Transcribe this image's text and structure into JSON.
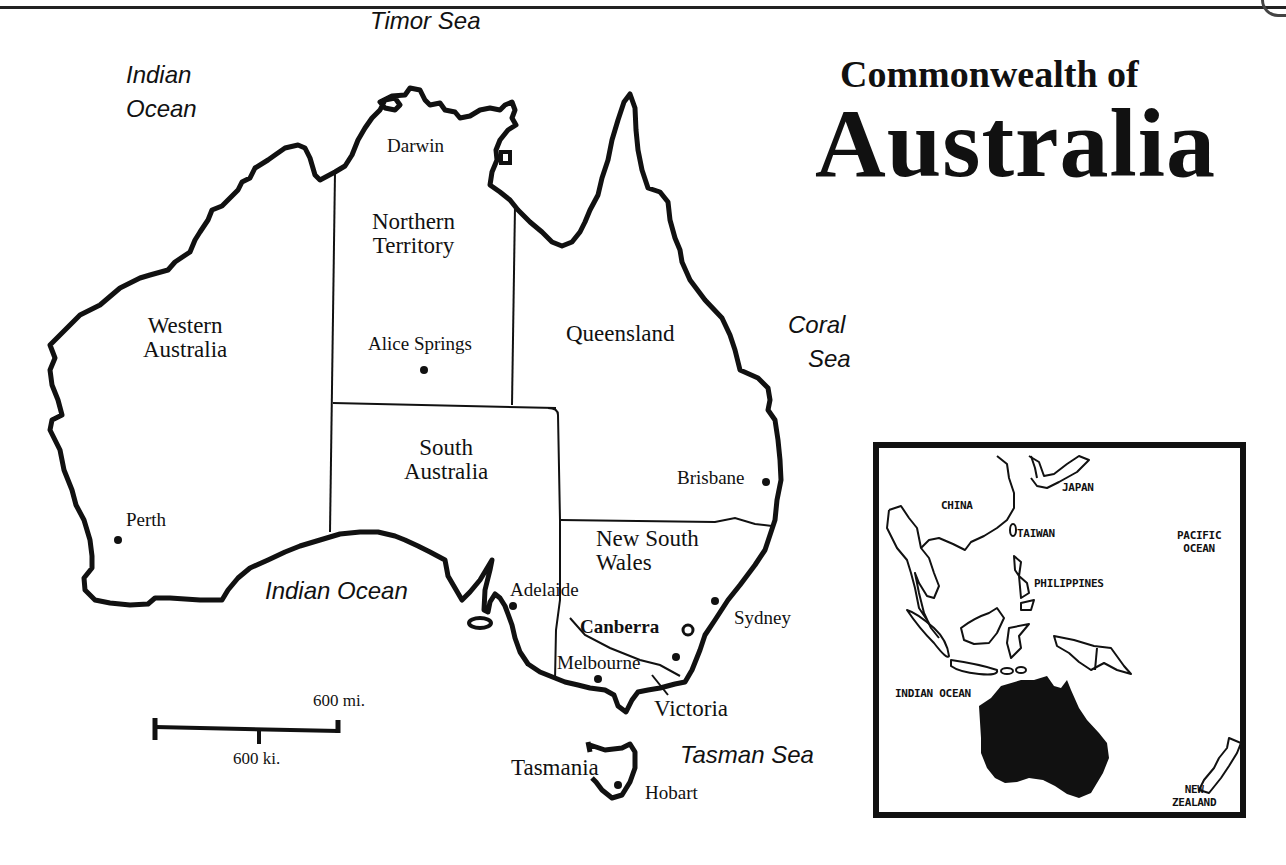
{
  "title": {
    "line1": "Commonwealth  of",
    "line2": "Australia"
  },
  "seas": {
    "timor_sea": "Timor Sea",
    "indian_ocean_nw_line1": "Indian",
    "indian_ocean_nw_line2": "Ocean",
    "indian_ocean_south": "Indian Ocean",
    "coral_sea_line1": "Coral",
    "coral_sea_line2": "Sea",
    "tasman_sea": "Tasman Sea"
  },
  "states": {
    "western_australia": [
      "Western",
      "Australia"
    ],
    "northern_territory": [
      "Northern",
      "Territory"
    ],
    "queensland": [
      "Queensland"
    ],
    "south_australia": [
      "South",
      "Australia"
    ],
    "new_south_wales": [
      "New South",
      "Wales"
    ],
    "victoria": [
      "Victoria"
    ],
    "tasmania": [
      "Tasmania"
    ]
  },
  "cities": {
    "darwin": "Darwin",
    "alice_springs": "Alice Springs",
    "perth": "Perth",
    "brisbane": "Brisbane",
    "adelaide": "Adelaide",
    "canberra": "Canberra",
    "sydney": "Sydney",
    "melbourne": "Melbourne",
    "hobart": "Hobart"
  },
  "scale": {
    "miles_label": "600 mi.",
    "km_label": "600 ki."
  },
  "inset": {
    "china": "CHINA",
    "japan": "JAPAN",
    "taiwan": "TAIWAN",
    "philippines": "PHILIPPINES",
    "pacific_line1": "PACIFIC",
    "pacific_line2": "OCEAN",
    "indian_ocean": "INDIAN OCEAN",
    "new_zealand_line1": "NEW",
    "new_zealand_line2": "ZEALAND"
  },
  "colors": {
    "ink": "#111111",
    "paper": "#ffffff"
  }
}
